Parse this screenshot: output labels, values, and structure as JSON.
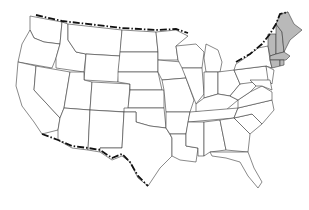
{
  "map": {
    "title": "United States map",
    "highlight_region": "New England",
    "highlighted_states": [
      "Maine",
      "New Hampshire",
      "Vermont",
      "Massachusetts",
      "Rhode Island",
      "Connecticut"
    ],
    "colors": {
      "highlight_fill": "#b9b9b9",
      "default_fill": "#ffffff",
      "state_outline": "#3a3a3a",
      "international_border": "#111111"
    },
    "border_style": "dash-dot international border"
  }
}
